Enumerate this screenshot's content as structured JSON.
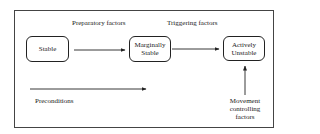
{
  "diagram": {
    "nodes": [
      {
        "id": "stable",
        "label": "Stable"
      },
      {
        "id": "marginally-stable",
        "label_line1": "Marginally",
        "label_line2": "Stable"
      },
      {
        "id": "actively-unstable",
        "label_line1": "Actively",
        "label_line2": "Unstable"
      }
    ],
    "edge_labels": {
      "preparatory": "Preparatory factors",
      "triggering": "Triggering factors",
      "preconditions": "Preconditions",
      "movement_line1": "Movement",
      "movement_line2": "controlling",
      "movement_line3": "factors"
    },
    "edges": [
      {
        "from": "stable",
        "to": "marginally-stable",
        "label": "Preparatory factors"
      },
      {
        "from": "marginally-stable",
        "to": "actively-unstable",
        "label": "Triggering factors"
      },
      {
        "from": "movement-controlling-factors",
        "to": "actively-unstable",
        "label": "Movement controlling factors"
      },
      {
        "type": "timeline",
        "label": "Preconditions"
      }
    ],
    "colors": {
      "stroke": "#222222",
      "background": "#ffffff"
    }
  }
}
